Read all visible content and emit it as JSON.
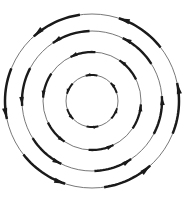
{
  "figure": {
    "background_color": "#ffffff",
    "ring_stroke_color": "#555555",
    "arrow_color": "#1a1a1a",
    "width": 185,
    "height": 207
  },
  "chart_data": {
    "type": "scatter",
    "subtitle": "",
    "xlabel": "",
    "ylabel": "",
    "xlim": [
      0,
      185
    ],
    "ylim": [
      0,
      207
    ],
    "grid": false,
    "legend": null,
    "annotations": [],
    "tick_labels_x": [],
    "tick_labels_y": [],
    "field": {
      "center": [
        92,
        101
      ],
      "rotation": "counterclockwise",
      "description": "Four concentric circular streamlines with tangential arrows; arrow length grows with radius",
      "ring_radii": [
        26,
        49,
        70,
        87
      ],
      "ring_stroke_widths": [
        0.8,
        0.8,
        0.8,
        0.8
      ]
    },
    "series": [
      {
        "name": "ring-1",
        "radius": 26,
        "arrow_count": 6,
        "arrow_span_deg": 26,
        "arrow_width": 2.0,
        "head_length": 5,
        "head_width": 3.4,
        "angles_deg": [
          78,
          138,
          198,
          258,
          318,
          18
        ]
      },
      {
        "name": "ring-2",
        "radius": 49,
        "arrow_count": 6,
        "arrow_span_deg": 30,
        "arrow_width": 2.3,
        "head_length": 7,
        "head_width": 4.0,
        "angles_deg": [
          86,
          146,
          206,
          266,
          326,
          26
        ]
      },
      {
        "name": "ring-3",
        "radius": 70,
        "arrow_count": 6,
        "arrow_span_deg": 32,
        "arrow_width": 2.4,
        "head_length": 9,
        "head_width": 4.6,
        "angles_deg": [
          92,
          152,
          212,
          272,
          332,
          32
        ]
      },
      {
        "name": "ring-4",
        "radius": 87,
        "arrow_count": 6,
        "arrow_span_deg": 34,
        "arrow_width": 2.5,
        "head_length": 11,
        "head_width": 5.2,
        "angles_deg": [
          98,
          158,
          218,
          278,
          338,
          38
        ]
      }
    ]
  }
}
